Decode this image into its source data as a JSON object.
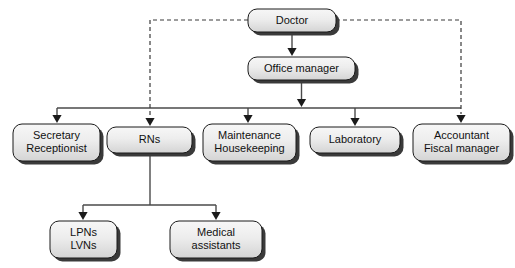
{
  "diagram": {
    "type": "organizational-chart",
    "background_color": "#ffffff",
    "box_fill_top": "#f4f4f4",
    "box_fill_bottom": "#d8d8d8",
    "box_border_color": "#1a1a1a",
    "box_shadow_color": "#3a3a3a",
    "solid_line_color": "#4a4a4a",
    "dashed_line_color": "#3a3a3a",
    "text_color": "#111111"
  },
  "nodes": {
    "doctor": {
      "label": "Doctor",
      "lines": [
        "Doctor"
      ],
      "x": 248,
      "y": 9,
      "w": 88,
      "h": 23,
      "level": 0
    },
    "office_manager": {
      "label": "Office manager",
      "lines": [
        "Office manager"
      ],
      "x": 248,
      "y": 57,
      "w": 107,
      "h": 23,
      "level": 1
    },
    "secretary": {
      "label": "Secretary Receptionist",
      "lines": [
        "Secretary",
        "Receptionist"
      ],
      "x": 13,
      "y": 124,
      "w": 87,
      "h": 37,
      "level": 2
    },
    "rns": {
      "label": "RNs",
      "lines": [
        "RNs"
      ],
      "x": 107,
      "y": 127,
      "w": 85,
      "h": 26,
      "level": 2
    },
    "maintenance": {
      "label": "Maintenance Housekeeping",
      "lines": [
        "Maintenance",
        "Housekeeping"
      ],
      "x": 203,
      "y": 124,
      "w": 93,
      "h": 37,
      "level": 2
    },
    "laboratory": {
      "label": "Laboratory",
      "lines": [
        "Laboratory"
      ],
      "x": 310,
      "y": 127,
      "w": 90,
      "h": 26,
      "level": 2
    },
    "accountant": {
      "label": "Accountant Fiscal manager",
      "lines": [
        "Accountant",
        "Fiscal manager"
      ],
      "x": 413,
      "y": 124,
      "w": 97,
      "h": 37,
      "level": 2
    },
    "lpns": {
      "label": "LPNs LVNs",
      "lines": [
        "LPNs",
        "LVNs"
      ],
      "x": 50,
      "y": 221,
      "w": 67,
      "h": 37,
      "level": 3
    },
    "medical_assistants": {
      "label": "Medical assistants",
      "lines": [
        "Medical",
        "assistants"
      ],
      "x": 170,
      "y": 221,
      "w": 92,
      "h": 37,
      "level": 3
    }
  },
  "connections": [
    {
      "id": "doctor-to-office-manager",
      "from": "doctor",
      "to": "office_manager",
      "style": "solid",
      "arrow": true
    },
    {
      "id": "doctor-to-rns-dashed",
      "from": "doctor",
      "to": "rns",
      "style": "dashed",
      "arrow": true
    },
    {
      "id": "doctor-to-accountant-dashed",
      "from": "doctor",
      "to": "accountant",
      "style": "dashed",
      "arrow": true
    },
    {
      "id": "office-manager-to-bus",
      "from": "office_manager",
      "to": "bus",
      "style": "solid",
      "arrow": true
    },
    {
      "id": "bus-to-secretary",
      "from": "bus",
      "to": "secretary",
      "style": "solid",
      "arrow": true
    },
    {
      "id": "bus-to-maintenance",
      "from": "bus",
      "to": "maintenance",
      "style": "solid",
      "arrow": true
    },
    {
      "id": "bus-to-laboratory",
      "from": "bus",
      "to": "laboratory",
      "style": "solid",
      "arrow": true
    },
    {
      "id": "rns-to-lpns",
      "from": "rns",
      "to": "lpns",
      "style": "solid",
      "arrow": true
    },
    {
      "id": "rns-to-medical-assistants",
      "from": "rns",
      "to": "medical_assistants",
      "style": "solid",
      "arrow": true
    }
  ],
  "geometry": {
    "bus_y": 108,
    "bus_x_left": 57,
    "bus_x_right": 461,
    "dashed_y": 20,
    "dashed_left_x": 150,
    "dashed_right_x": 461,
    "rns_branch_y": 205,
    "rns_stem_x": 150,
    "lpns_arrow_x": 83,
    "medical_arrow_x": 216,
    "drop_arrow_xs": [
      57,
      150,
      248,
      355,
      461
    ],
    "office_manager_arrow_x": 303
  }
}
